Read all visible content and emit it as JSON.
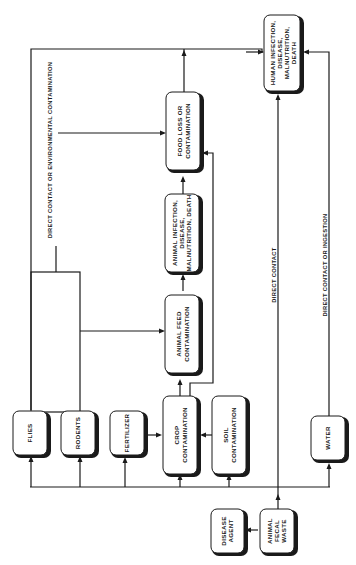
{
  "diagram": {
    "orientation": "rotated-90-ccw",
    "nodes": [
      {
        "id": "human",
        "label_lines": [
          "HUMAN INFECTION,",
          "DISEASE,",
          "MALNUTRITION,",
          "DEATH"
        ]
      },
      {
        "id": "food_loss",
        "label_lines": [
          "FOOD LOSS OR",
          "CONTAMINATION"
        ]
      },
      {
        "id": "animal_infection",
        "label_lines": [
          "ANIMAL INFECTION,",
          "DISEASE,",
          "MALNUTRITION, DEATH"
        ]
      },
      {
        "id": "animal_feed",
        "label_lines": [
          "ANIMAL FEED",
          "CONTAMINATION"
        ]
      },
      {
        "id": "crop",
        "label_lines": [
          "CROP",
          "CONTAMINATION"
        ]
      },
      {
        "id": "soil",
        "label_lines": [
          "SOIL",
          "CONTAMINATION"
        ]
      },
      {
        "id": "flies",
        "label_lines": [
          "FLIES"
        ]
      },
      {
        "id": "rodents",
        "label_lines": [
          "RODENTS"
        ]
      },
      {
        "id": "fertilizer",
        "label_lines": [
          "FERTILIZER"
        ]
      },
      {
        "id": "water",
        "label_lines": [
          "WATER"
        ]
      },
      {
        "id": "disease_agent",
        "label_lines": [
          "DISEASE",
          "AGENT"
        ]
      },
      {
        "id": "fecal_waste",
        "label_lines": [
          "ANIMAL",
          "FECAL",
          "WASTE"
        ]
      }
    ],
    "edge_labels": {
      "environmental": "DIRECT CONTACT OR ENVIRONMENTAL CONTAMINATION",
      "direct_contact": "DIRECT CONTACT",
      "ingestion": "DIRECT CONTACT OR INGESTION"
    },
    "edges": [
      {
        "from": "disease_agent",
        "to": "fecal_waste"
      },
      {
        "from": "fecal_waste",
        "to": "flies"
      },
      {
        "from": "fecal_waste",
        "to": "rodents"
      },
      {
        "from": "fecal_waste",
        "to": "fertilizer"
      },
      {
        "from": "fecal_waste",
        "to": "crop"
      },
      {
        "from": "fecal_waste",
        "to": "soil"
      },
      {
        "from": "fecal_waste",
        "to": "water"
      },
      {
        "from": "fecal_waste",
        "to": "human",
        "label": "DIRECT CONTACT"
      },
      {
        "from": "water",
        "to": "human",
        "label": "DIRECT CONTACT OR INGESTION"
      },
      {
        "from": "fertilizer",
        "to": "crop"
      },
      {
        "from": "soil",
        "to": "crop"
      },
      {
        "from": "crop",
        "to": "animal_feed"
      },
      {
        "from": "crop",
        "to": "food_loss"
      },
      {
        "from": "animal_feed",
        "to": "animal_infection"
      },
      {
        "from": "animal_infection",
        "to": "food_loss"
      },
      {
        "from": "food_loss",
        "to": "human"
      },
      {
        "from": "flies",
        "to": "animal_feed"
      },
      {
        "from": "rodents",
        "to": "animal_feed"
      },
      {
        "from": "flies",
        "to": "food_loss",
        "label": "DIRECT CONTACT OR ENVIRONMENTAL CONTAMINATION"
      },
      {
        "from": "flies",
        "to": "human"
      }
    ]
  }
}
